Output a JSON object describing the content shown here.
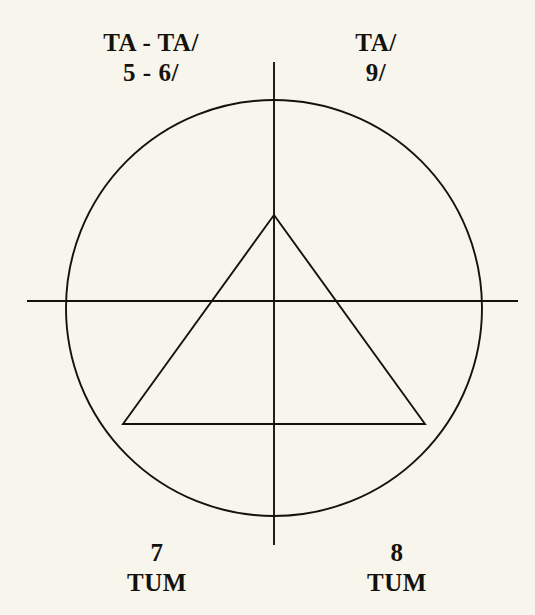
{
  "figure": {
    "background_color": "#f7f5ec",
    "ink_color": "#14120d",
    "labels": {
      "top_left": {
        "line1": "TA - TA/",
        "line2": "5 - 6/"
      },
      "top_right": {
        "line1": "TA/",
        "line2": "9/"
      },
      "bottom_left": {
        "line1": "7",
        "line2": "TUM"
      },
      "bottom_right": {
        "line1": "8",
        "line2": "TUM"
      }
    },
    "geometry": {
      "circle": {
        "cx": 274,
        "cy": 308,
        "r": 208
      },
      "horizontal_axis": {
        "x1": 27,
        "y1": 301,
        "x2": 518,
        "y2": 301
      },
      "vertical_axis": {
        "x1": 274,
        "y1": 62,
        "x2": 274,
        "y2": 545
      },
      "triangle": {
        "apex_x": 274,
        "apex_y": 215,
        "base_left_x": 123,
        "base_right_x": 425,
        "base_y": 424
      }
    }
  }
}
